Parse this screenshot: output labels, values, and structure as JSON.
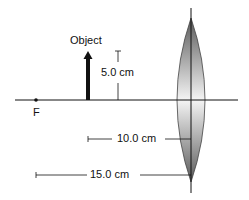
{
  "diagram": {
    "object_label": "Object",
    "height_label": "5.0 cm",
    "focal_label": "F",
    "distance_object_label": "10.0 cm",
    "distance_focal_label": "15.0 cm"
  },
  "colors": {
    "line": "#111111",
    "lens_dark": "#6e6e6e",
    "lens_light": "#f2f2f2"
  }
}
